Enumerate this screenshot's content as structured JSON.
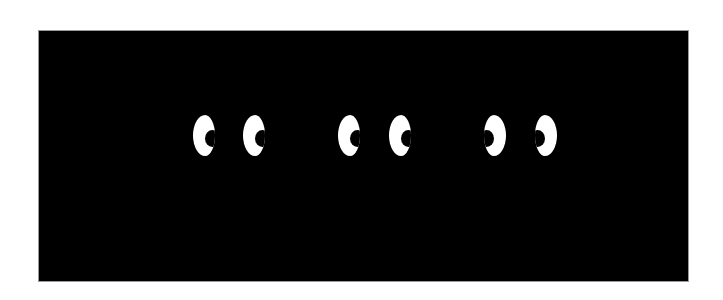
{
  "canvas": {
    "width": 723,
    "height": 300,
    "background": "#ffffff"
  },
  "panel": {
    "x": 39,
    "y": 31,
    "width": 649,
    "height": 250,
    "color": "#000000",
    "border_color": "#9a9a9a"
  },
  "eye_pairs": [
    {
      "id": "pair-1",
      "gaze": "right",
      "eyes": [
        {
          "x": 193,
          "y": 115,
          "width": 21,
          "height": 41,
          "pupil_side": "right"
        },
        {
          "x": 243,
          "y": 115,
          "width": 22,
          "height": 41,
          "pupil_side": "right"
        }
      ]
    },
    {
      "id": "pair-2",
      "gaze": "right",
      "eyes": [
        {
          "x": 338,
          "y": 115,
          "width": 21,
          "height": 41,
          "pupil_side": "right"
        },
        {
          "x": 389,
          "y": 115,
          "width": 22,
          "height": 41,
          "pupil_side": "right"
        }
      ]
    },
    {
      "id": "pair-3",
      "gaze": "left",
      "eyes": [
        {
          "x": 484,
          "y": 115,
          "width": 22,
          "height": 41,
          "pupil_side": "left"
        },
        {
          "x": 535,
          "y": 115,
          "width": 22,
          "height": 41,
          "pupil_side": "left"
        }
      ]
    }
  ],
  "colors": {
    "eye_white": "#ffffff",
    "pupil": "#000000"
  }
}
